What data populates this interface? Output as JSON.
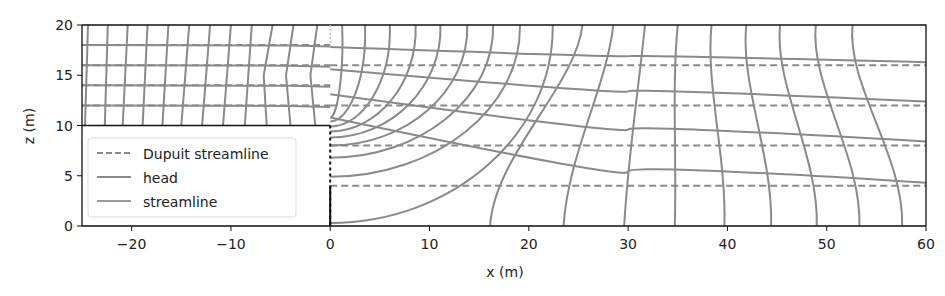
{
  "chart_data": {
    "type": "line",
    "title": "",
    "xlabel": "x (m)",
    "ylabel": "z (m)",
    "xlim": [
      -25,
      60
    ],
    "ylim": [
      0,
      20
    ],
    "xticks": [
      -20,
      -10,
      0,
      10,
      20,
      30,
      40,
      50,
      60
    ],
    "xtick_labels": [
      "−20",
      "−10",
      "0",
      "10",
      "20",
      "30",
      "40",
      "50",
      "60"
    ],
    "yticks": [
      0,
      5,
      10,
      15,
      20
    ],
    "ytick_labels": [
      "0",
      "5",
      "10",
      "15",
      "20"
    ],
    "grid": false,
    "legend": {
      "position": "lower left",
      "entries": [
        {
          "label": "Dupuit streamline",
          "style": "dashed"
        },
        {
          "label": "head",
          "style": "solid"
        },
        {
          "label": "streamline",
          "style": "solid"
        }
      ]
    },
    "colors": {
      "line": "#8a8a8a",
      "axis": "#111111"
    },
    "domain_geometry": {
      "well_x": 0,
      "left_block_top_z": 10,
      "description": "Flow net: aquifer z 0-20 right of x=0; upper layer z 10-20 left of x=0"
    },
    "series": [
      {
        "name": "Dupuit streamline",
        "style": "dashed",
        "z_levels_left": [
          18,
          16,
          14,
          12
        ],
        "z_levels_right": [
          16,
          12,
          8,
          4
        ]
      },
      {
        "name": "streamline",
        "style": "solid",
        "left_z_levels": [
          18,
          16,
          14,
          12
        ],
        "right_paths": [
          [
            [
              0,
              17.8
            ],
            [
              30,
              16.9
            ],
            [
              60,
              16.3
            ]
          ],
          [
            [
              0,
              15.6
            ],
            [
              30,
              13.4
            ],
            [
              60,
              12.4
            ]
          ],
          [
            [
              0,
              13.1
            ],
            [
              30,
              9.6
            ],
            [
              60,
              8.4
            ]
          ],
          [
            [
              0,
              10.8
            ],
            [
              30,
              5.4
            ],
            [
              60,
              4.3
            ]
          ]
        ]
      },
      {
        "name": "head",
        "style": "solid",
        "left_top_x": [
          -24.4,
          -22.4,
          -20.4,
          -18.4,
          -16.3,
          -14.2,
          -12.1,
          -10.0,
          -7.9,
          -5.8,
          -3.7,
          -1.3
        ],
        "left_bottom_x": [
          -24.7,
          -22.7,
          -20.9,
          -18.9,
          -16.9,
          -15.0,
          -12.9,
          -10.8,
          -8.6,
          -6.4,
          -4.0,
          -1.5
        ],
        "right_top_x": [
          1.2,
          3.5,
          6.0,
          8.6,
          11.1,
          13.8,
          16.4,
          19.1,
          22.4,
          25.4,
          28.5,
          31.7,
          35.0,
          38.4,
          41.9,
          45.3,
          48.9,
          52.6,
          56.1
        ],
        "right_end_on_well_z": [
          10.8,
          10.4,
          9.9,
          9.4,
          8.8,
          8.0,
          6.8,
          4.9,
          0.3
        ],
        "right_bottom_x": [
          16.1,
          23.5,
          29.6,
          34.7,
          39.7,
          44.4,
          49.0,
          53.3,
          57.6
        ]
      }
    ]
  }
}
